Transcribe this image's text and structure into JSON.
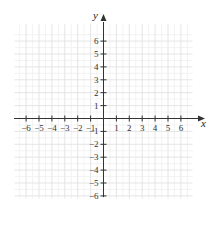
{
  "chart_data": {
    "type": "scatter",
    "title": "",
    "xlabel": "x",
    "ylabel": "y",
    "xlim": [
      -7,
      7
    ],
    "ylim": [
      -7,
      7
    ],
    "grid": true,
    "x_ticks": [
      -6,
      -5,
      -4,
      -3,
      -2,
      -1,
      1,
      2,
      3,
      4,
      5,
      6
    ],
    "y_ticks": [
      -6,
      -5,
      -4,
      -3,
      -2,
      -1,
      1,
      2,
      3,
      4,
      5,
      6
    ],
    "x_tick_labels": [
      "−6",
      "−5",
      "−4",
      "−3",
      "−2",
      "−1",
      "1",
      "2",
      "3",
      "4",
      "5",
      "6"
    ],
    "y_tick_labels": [
      "−6",
      "−5",
      "−4",
      "−3",
      "−2",
      "−1",
      "1",
      "2",
      "3",
      "4",
      "5",
      "6"
    ],
    "series": [],
    "legend": null
  },
  "colors": {
    "axis": "#333333",
    "grid_major": "#e2e2e2",
    "grid_minor": "#f0f0f0",
    "text": "#333333"
  }
}
